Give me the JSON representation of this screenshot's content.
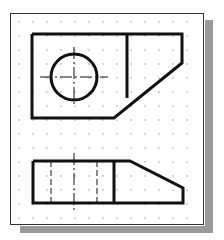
{
  "figure": {
    "title": ""
  },
  "colors": {
    "line": "#111111",
    "grid_dot": "#8a8a8a",
    "shadow": "#9a9a9a",
    "sheet": "#ffffff",
    "frame": "#333333"
  },
  "grid": {
    "spacing": 14,
    "x_start": 19,
    "y_start": 22,
    "x_end": 200,
    "y_end": 222
  },
  "top_view": {
    "outline_points": "32,34 182,34 182,63 114,118 32,118 32,34",
    "divider": {
      "x1": 127,
      "y1": 34,
      "x2": 127,
      "y2": 98
    },
    "circle": {
      "cx": 74,
      "cy": 77,
      "r": 23
    },
    "center_line_h": {
      "x1": 40,
      "y1": 77,
      "x2": 108,
      "y2": 77
    },
    "center_line_v": {
      "x1": 74,
      "y1": 47,
      "x2": 74,
      "y2": 107
    }
  },
  "front_view": {
    "outline_points": "33,161 130,161 183,188 183,203 33,203 33,161",
    "divider": {
      "x1": 114,
      "y1": 161,
      "x2": 114,
      "y2": 203
    },
    "hidden_lines": [
      {
        "x1": 51,
        "y1": 161,
        "x2": 51,
        "y2": 203
      },
      {
        "x1": 97,
        "y1": 161,
        "x2": 97,
        "y2": 203
      }
    ],
    "center_line_v": {
      "x1": 74,
      "y1": 153,
      "x2": 74,
      "y2": 211
    }
  }
}
